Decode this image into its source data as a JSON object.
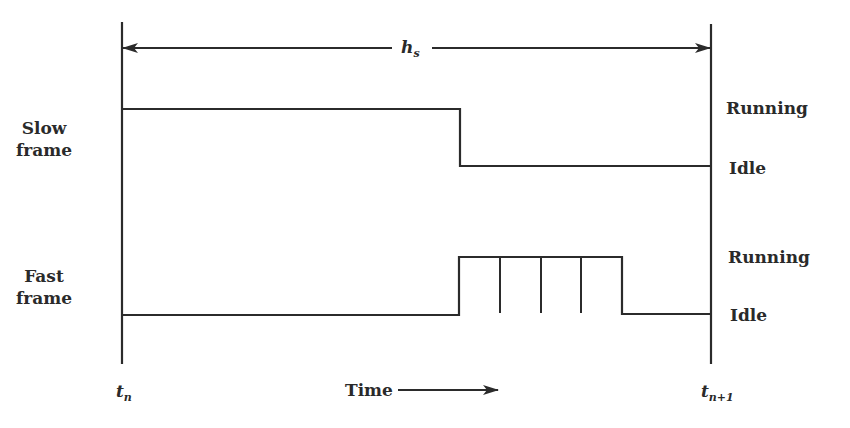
{
  "diagram": {
    "period_label": {
      "base": "h",
      "sub": "s"
    },
    "rows": [
      {
        "name": "Slow frame",
        "line1": "Slow",
        "line2": "frame",
        "high_label": "Running",
        "low_label": "Idle"
      },
      {
        "name": "Fast frame",
        "line1": "Fast",
        "line2": "frame",
        "high_label": "Running",
        "low_label": "Idle"
      }
    ],
    "time_start": {
      "base": "t",
      "sub": "n"
    },
    "time_end": {
      "base": "t",
      "sub": "n+1"
    },
    "time_axis_label": "Time",
    "colors": {
      "line": "#2b2b2b",
      "background": "#ffffff"
    },
    "signals": {
      "slow_frame": [
        {
          "state": "Running",
          "from_x": 122,
          "to_x": 460
        },
        {
          "state": "Idle",
          "from_x": 460,
          "to_x": 711
        }
      ],
      "fast_frame": [
        {
          "state": "Idle",
          "from_x": 122,
          "to_x": 459
        },
        {
          "state": "Running",
          "from_x": 459,
          "to_x": 622,
          "sub_intervals": 4
        },
        {
          "state": "Idle",
          "from_x": 622,
          "to_x": 711
        }
      ]
    }
  }
}
